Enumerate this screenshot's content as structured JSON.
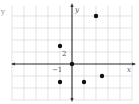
{
  "figure": {
    "corner_label": "y"
  },
  "chart_data": {
    "type": "scatter",
    "title": "",
    "xlabel": "x",
    "ylabel": "y",
    "tick_labels": {
      "x": "−1",
      "y": "2"
    },
    "x_unit_per_cell": 1,
    "y_unit_per_cell": 2,
    "xlim": [
      -5,
      5
    ],
    "ylim": [
      -6,
      10
    ],
    "grid": true,
    "points": [
      {
        "x": 0,
        "y": 0
      },
      {
        "x": 2,
        "y": 8
      },
      {
        "x": -1,
        "y": 3
      },
      {
        "x": -1,
        "y": -3
      },
      {
        "x": 1,
        "y": -3
      },
      {
        "x": 2.5,
        "y": -2
      }
    ],
    "colors": {
      "grid": "#d6d6d6",
      "axis": "#333333",
      "point": "#111111",
      "label": "#555555"
    }
  }
}
